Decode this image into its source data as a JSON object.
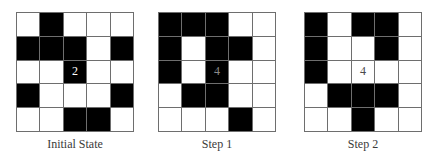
{
  "panels": [
    {
      "label": "Initial State",
      "center_value": "2",
      "center_text_style": "white",
      "grid": [
        [
          0,
          1,
          0,
          0,
          0
        ],
        [
          1,
          1,
          1,
          0,
          1
        ],
        [
          0,
          0,
          1,
          0,
          0
        ],
        [
          1,
          0,
          0,
          0,
          1
        ],
        [
          0,
          0,
          1,
          1,
          0
        ]
      ]
    },
    {
      "label": "Step 1",
      "center_value": "4",
      "center_text_style": "gray",
      "grid": [
        [
          1,
          1,
          1,
          0,
          0
        ],
        [
          1,
          0,
          1,
          1,
          0
        ],
        [
          1,
          0,
          1,
          0,
          0
        ],
        [
          0,
          1,
          1,
          0,
          0
        ],
        [
          0,
          0,
          0,
          1,
          0
        ]
      ]
    },
    {
      "label": "Step 2",
      "center_value": "4",
      "center_text_style": "dark",
      "grid": [
        [
          1,
          0,
          1,
          1,
          0
        ],
        [
          1,
          0,
          0,
          1,
          0
        ],
        [
          1,
          0,
          0,
          0,
          0
        ],
        [
          0,
          1,
          1,
          1,
          0
        ],
        [
          0,
          0,
          1,
          0,
          0
        ]
      ]
    }
  ],
  "colors": {
    "filled": "#000000",
    "empty": "#ffffff",
    "gridline": "#6e6e6e"
  }
}
